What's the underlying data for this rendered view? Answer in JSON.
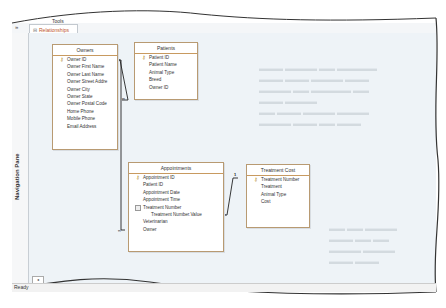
{
  "window": {
    "context_tab_label": "Tools",
    "active_tab": "Relationships",
    "nav_toggle_glyph": "»",
    "nav_pane_label": "Navigation Pane",
    "status_text": "Ready",
    "scroll_left_glyph": "◂"
  },
  "tables": [
    {
      "name": "Owners",
      "fields": [
        {
          "label": "Owner ID",
          "key": true
        },
        {
          "label": "Owner First Name"
        },
        {
          "label": "Owner Last Name"
        },
        {
          "label": "Owner Street Addre"
        },
        {
          "label": "Owner City"
        },
        {
          "label": "Owner State"
        },
        {
          "label": "Owner Postal Code"
        },
        {
          "label": "Home Phone"
        },
        {
          "label": "Mobile Phone"
        },
        {
          "label": "Email Address"
        }
      ]
    },
    {
      "name": "Patients",
      "fields": [
        {
          "label": "Patient ID",
          "key": true
        },
        {
          "label": "Patient Name"
        },
        {
          "label": "Animal Type"
        },
        {
          "label": "Breed"
        },
        {
          "label": "Owner ID"
        }
      ]
    },
    {
      "name": "Appointments",
      "fields": [
        {
          "label": "Appointment ID",
          "key": true
        },
        {
          "label": "Patient ID"
        },
        {
          "label": "Appointment Date"
        },
        {
          "label": "Appointment Time"
        },
        {
          "label": "Treatment Number",
          "expand": true
        },
        {
          "label": "Treatment Number.Value",
          "sub": true
        },
        {
          "label": "Veterinarian"
        },
        {
          "label": "Owner"
        }
      ]
    },
    {
      "name": "Treatment Cost",
      "fields": [
        {
          "label": "Treatment Number",
          "key": true
        },
        {
          "label": "Treatment"
        },
        {
          "label": "Animal Type"
        },
        {
          "label": "Cost"
        }
      ]
    }
  ],
  "relationships": {
    "one_label": "1",
    "many_label": "∞"
  }
}
